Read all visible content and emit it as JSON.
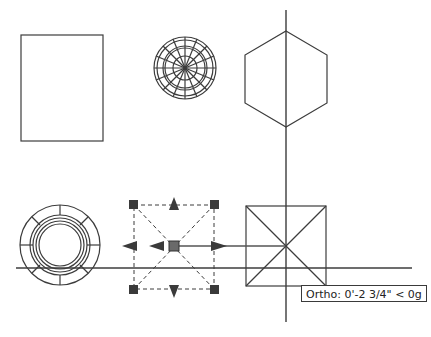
{
  "drawing": {
    "line_color": "#3c3c3c",
    "grip_color": "#3a3a3a",
    "background": "#ffffff"
  },
  "crosshair": {
    "x": 286,
    "y": 268,
    "h_start": 16,
    "h_end": 412,
    "v_start": 10,
    "v_end": 322
  },
  "objects": [
    {
      "type": "rectangle",
      "x": 21,
      "y": 35,
      "w": 82,
      "h": 106
    },
    {
      "type": "sphere-wireframe",
      "cx": 185,
      "cy": 68,
      "r": 31
    },
    {
      "type": "hexagon",
      "cx": 286,
      "cy": 79,
      "r": 48
    },
    {
      "type": "torus-top-view",
      "cx": 60,
      "cy": 245,
      "r": 40
    },
    {
      "type": "pyramid-top-view",
      "x": 246,
      "y": 206,
      "w": 80,
      "h": 80
    },
    {
      "type": "selected-dashed-square",
      "x": 134,
      "y": 205,
      "w": 80,
      "h": 84
    }
  ],
  "tooltip": {
    "text": "Ortho: 0'-2 3/4\" < 0g"
  }
}
